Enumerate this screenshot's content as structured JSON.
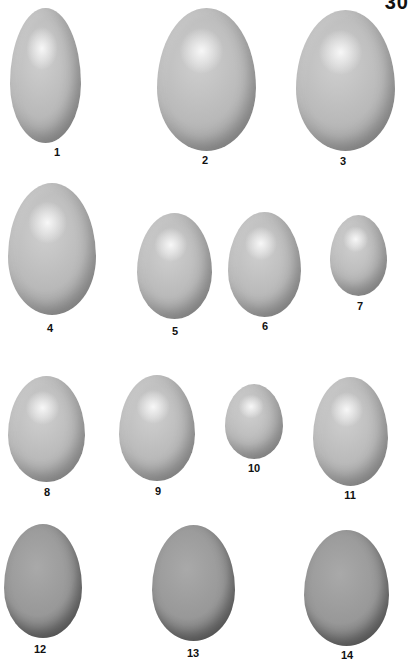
{
  "page": {
    "page_number": "30",
    "background": "#ffffff"
  },
  "eggs": [
    {
      "label": "1",
      "tone": "light",
      "x": 10,
      "y": 8,
      "w": 71,
      "h": 135,
      "lx": 57,
      "ly": 146
    },
    {
      "label": "2",
      "tone": "light",
      "x": 157,
      "y": 8,
      "w": 99,
      "h": 143,
      "lx": 205,
      "ly": 154
    },
    {
      "label": "3",
      "tone": "light",
      "x": 296,
      "y": 10,
      "w": 99,
      "h": 141,
      "lx": 343,
      "ly": 155
    },
    {
      "label": "4",
      "tone": "light",
      "x": 8,
      "y": 183,
      "w": 88,
      "h": 132,
      "lx": 50,
      "ly": 322
    },
    {
      "label": "5",
      "tone": "light",
      "x": 137,
      "y": 213,
      "w": 75,
      "h": 106,
      "lx": 175,
      "ly": 325
    },
    {
      "label": "6",
      "tone": "light",
      "x": 228,
      "y": 212,
      "w": 73,
      "h": 105,
      "lx": 265,
      "ly": 320
    },
    {
      "label": "7",
      "tone": "light",
      "x": 330,
      "y": 215,
      "w": 57,
      "h": 81,
      "lx": 360,
      "ly": 300
    },
    {
      "label": "8",
      "tone": "light",
      "x": 8,
      "y": 376,
      "w": 77,
      "h": 106,
      "lx": 47,
      "ly": 486
    },
    {
      "label": "9",
      "tone": "light",
      "x": 119,
      "y": 375,
      "w": 76,
      "h": 106,
      "lx": 158,
      "ly": 485
    },
    {
      "label": "10",
      "tone": "light",
      "x": 225,
      "y": 384,
      "w": 58,
      "h": 75,
      "lx": 254,
      "ly": 462
    },
    {
      "label": "11",
      "tone": "light",
      "x": 313,
      "y": 377,
      "w": 75,
      "h": 109,
      "lx": 350,
      "ly": 489
    },
    {
      "label": "12",
      "tone": "dark",
      "x": 4,
      "y": 524,
      "w": 78,
      "h": 114,
      "lx": 40,
      "ly": 643
    },
    {
      "label": "13",
      "tone": "dark",
      "x": 152,
      "y": 525,
      "w": 83,
      "h": 116,
      "lx": 193,
      "ly": 647
    },
    {
      "label": "14",
      "tone": "dark",
      "x": 304,
      "y": 530,
      "w": 85,
      "h": 116,
      "lx": 347,
      "ly": 649
    }
  ]
}
